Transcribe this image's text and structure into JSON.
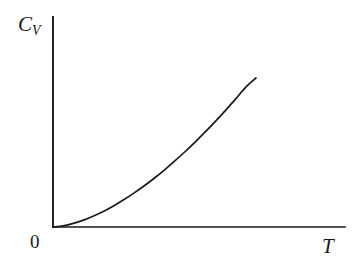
{
  "figure": {
    "background_color": "#ffffff",
    "ink_color": "#1a1a1a",
    "width": 354,
    "height": 270
  },
  "labels": {
    "y_axis_symbol": "C",
    "y_axis_subscript": "V",
    "y_axis_full": "C_V",
    "x_axis_symbol": "T",
    "origin": "0"
  },
  "chart_data": {
    "type": "line",
    "title": "",
    "xlabel": "T",
    "ylabel": "C_V",
    "subtitle": "",
    "grid": false,
    "legend": null,
    "ticks": {
      "x": [],
      "y": []
    },
    "tick_labels": {
      "x": [
        "0"
      ],
      "y": []
    },
    "xlim": [
      0,
      1
    ],
    "ylim": [
      0,
      1
    ],
    "annotations": [],
    "series": [
      {
        "name": "C_V(T)",
        "color": "#1a1a1a",
        "line_width": 1.7,
        "x": [
          0.0,
          0.05,
          0.1,
          0.15,
          0.2,
          0.25,
          0.3,
          0.35,
          0.4,
          0.45,
          0.5,
          0.55,
          0.6,
          0.65,
          0.7,
          0.75,
          0.8,
          0.85,
          0.9,
          0.95,
          1.0
        ],
        "y": [
          0.0,
          0.008,
          0.024,
          0.046,
          0.074,
          0.106,
          0.143,
          0.184,
          0.229,
          0.277,
          0.329,
          0.384,
          0.443,
          0.505,
          0.57,
          0.638,
          0.709,
          0.783,
          0.86,
          0.939,
          1.0
        ]
      }
    ]
  },
  "geometry": {
    "origin_px": [
      53,
      227
    ],
    "y_axis_top_px": [
      53,
      17
    ],
    "x_axis_right_px": [
      345,
      227
    ],
    "curve_end_px": [
      256,
      78
    ]
  }
}
